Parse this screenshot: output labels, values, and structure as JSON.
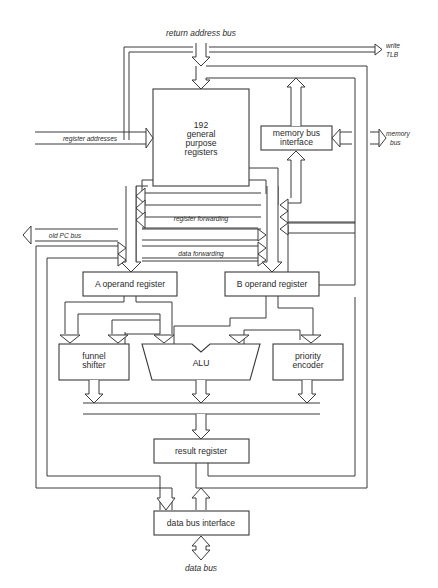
{
  "diagram": {
    "type": "processor-datapath-block-diagram",
    "background": "#ffffff",
    "line_color": "#3a3a3a",
    "blocks": {
      "registers": {
        "line1": "192",
        "line2": "general",
        "line3": "purpose",
        "line4": "registers"
      },
      "memory_bus_interface": {
        "line1": "memory bus",
        "line2": "interface"
      },
      "a_operand": {
        "label": "A operand register"
      },
      "b_operand": {
        "label": "B operand register"
      },
      "funnel_shifter": {
        "line1": "funnel",
        "line2": "shifter"
      },
      "alu": {
        "label": "ALU"
      },
      "priority_encoder": {
        "line1": "priority",
        "line2": "encoder"
      },
      "result_register": {
        "label": "result register"
      },
      "data_bus_interface": {
        "label": "data bus interface"
      }
    },
    "bus_labels": {
      "return_address_bus": "return address bus",
      "write_tlb_line1": "write",
      "write_tlb_line2": "TLB",
      "register_addresses": "register addresses",
      "memory_bus_line1": "memory",
      "memory_bus_line2": "bus",
      "register_forwarding": "register forwarding",
      "data_forwarding": "data forwarding",
      "old_pc_bus": "old PC bus",
      "data_bus": "data bus"
    }
  }
}
